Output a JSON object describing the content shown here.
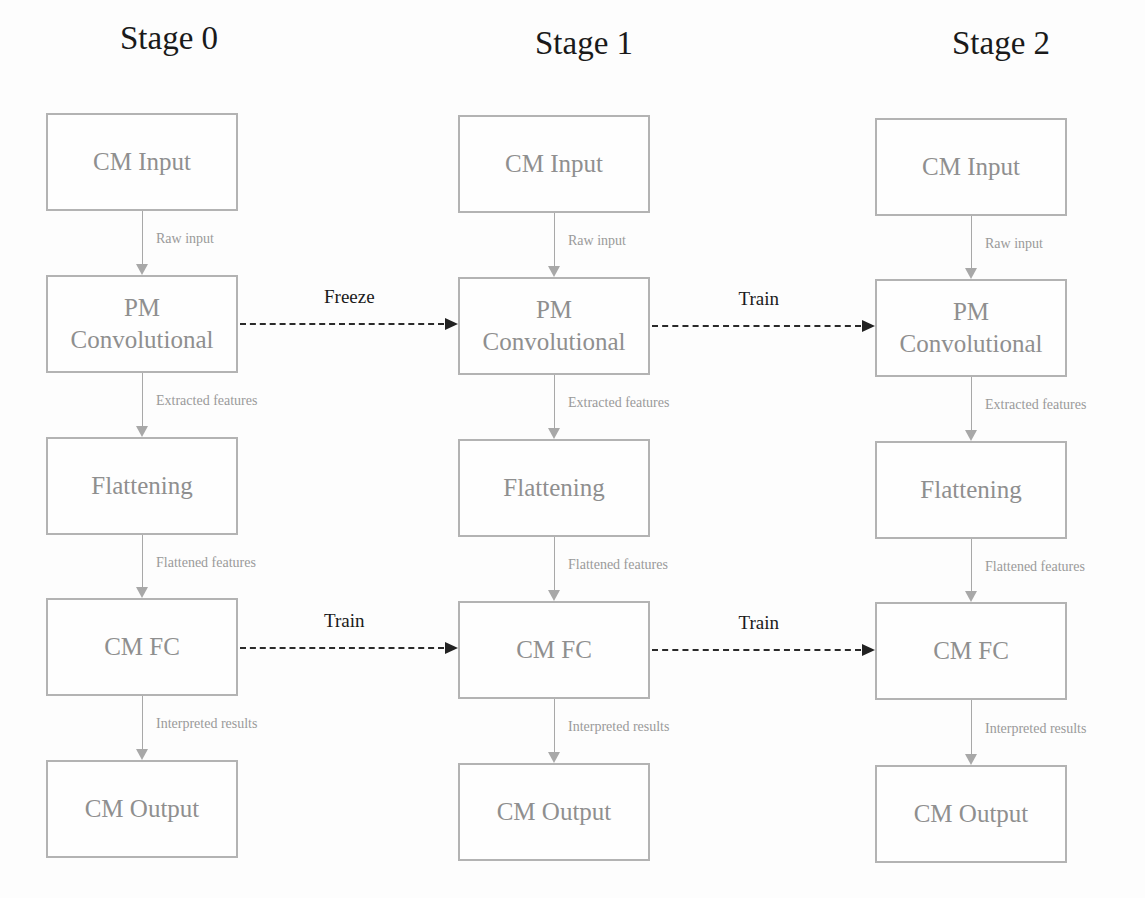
{
  "diagram": {
    "stages": [
      {
        "title": "Stage 0",
        "boxes": [
          "CM Input",
          "PM Convolutional",
          "Flattening",
          "CM FC",
          "CM Output"
        ],
        "box_lines": [
          [
            "CM Input"
          ],
          [
            "PM",
            "Convolutional"
          ],
          [
            "Flattening"
          ],
          [
            "CM FC"
          ],
          [
            "CM Output"
          ]
        ],
        "edges": [
          "Raw input",
          "Extracted features",
          "Flattened features",
          "Interpreted results"
        ]
      },
      {
        "title": "Stage 1",
        "boxes": [
          "CM Input",
          "PM Convolutional",
          "Flattening",
          "CM FC",
          "CM Output"
        ],
        "box_lines": [
          [
            "CM Input"
          ],
          [
            "PM",
            "Convolutional"
          ],
          [
            "Flattening"
          ],
          [
            "CM FC"
          ],
          [
            "CM Output"
          ]
        ],
        "edges": [
          "Raw input",
          "Extracted features",
          "Flattened features",
          "Interpreted results"
        ]
      },
      {
        "title": "Stage 2",
        "boxes": [
          "CM Input",
          "PM Convolutional",
          "Flattening",
          "CM FC",
          "CM Output"
        ],
        "box_lines": [
          [
            "CM Input"
          ],
          [
            "PM",
            "Convolutional"
          ],
          [
            "Flattening"
          ],
          [
            "CM FC"
          ],
          [
            "CM Output"
          ]
        ],
        "edges": [
          "Raw input",
          "Extracted features",
          "Flattened features",
          "Interpreted results"
        ]
      }
    ],
    "transitions": [
      {
        "from": "Stage 0 PM Convolutional",
        "to": "Stage 1 PM Convolutional",
        "label": "Freeze",
        "style": "dashed"
      },
      {
        "from": "Stage 1 PM Convolutional",
        "to": "Stage 2 PM Convolutional",
        "label": "Train",
        "style": "dashed"
      },
      {
        "from": "Stage 0 CM FC",
        "to": "Stage 1 CM FC",
        "label": "Train",
        "style": "dashed"
      },
      {
        "from": "Stage 1 CM FC",
        "to": "Stage 2 CM FC",
        "label": "Train",
        "style": "dashed"
      }
    ],
    "colors": {
      "box_border": "#b3b3b3",
      "box_text": "#8f8f8f",
      "edge": "#a8a8a8",
      "transition": "#2a2a2a",
      "title": "#1a1a1a"
    }
  }
}
